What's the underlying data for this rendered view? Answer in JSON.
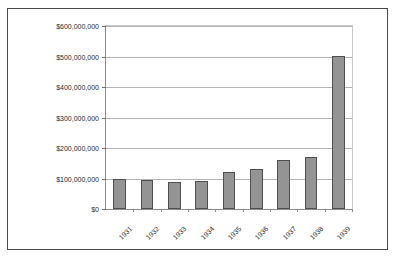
{
  "chart_data": {
    "type": "bar",
    "title": "",
    "subtitle": "",
    "xlabel": "",
    "ylabel": "",
    "categories": [
      "1931",
      "1932",
      "1933",
      "1934",
      "1935",
      "1936",
      "1937",
      "1938",
      "1939"
    ],
    "values": [
      100000000,
      95000000,
      87000000,
      91000000,
      120000000,
      132000000,
      160000000,
      172000000,
      503000000
    ],
    "ylim": [
      0,
      600000000
    ],
    "ytick_values": [
      0,
      100000000,
      200000000,
      300000000,
      400000000,
      500000000,
      600000000
    ],
    "ytick_labels": [
      "$0",
      "$100,000,000",
      "$200,000,000",
      "$300,000,000",
      "$400,000,000",
      "$500,000,000",
      "$600,000,000"
    ],
    "grid": true,
    "grid_axis": "y",
    "legend": false,
    "legend_position": "none",
    "series": [
      {
        "name": "",
        "values": [
          100000000,
          95000000,
          87000000,
          91000000,
          120000000,
          132000000,
          160000000,
          172000000,
          503000000
        ]
      }
    ],
    "bar_fill_color": "#949494",
    "bar_edge_color": "#4f4f4f",
    "plot_background_color": "#ffffff",
    "gridline_color": "#b4b4b4",
    "axis_color": "#8c8c8c",
    "frame_border_color": "#4a4a4a",
    "xtick_label_rotation": -45
  }
}
